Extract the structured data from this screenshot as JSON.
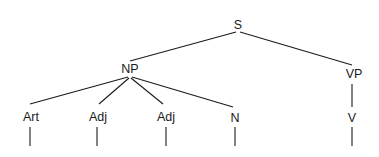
{
  "diagram": {
    "type": "syntax-tree",
    "nodes": {
      "s": {
        "label": "S",
        "x": 238,
        "y": 29
      },
      "np": {
        "label": "NP",
        "x": 130,
        "y": 72
      },
      "vp": {
        "label": "VP",
        "x": 355,
        "y": 77
      },
      "art": {
        "label": "Art",
        "x": 31,
        "y": 121
      },
      "adj1": {
        "label": "Adj",
        "x": 97,
        "y": 121
      },
      "adj2": {
        "label": "Adj",
        "x": 166,
        "y": 121
      },
      "n": {
        "label": "N",
        "x": 235,
        "y": 122
      },
      "v": {
        "label": "V",
        "x": 352,
        "y": 122
      }
    },
    "edges": [
      {
        "from": "S",
        "to": "NP"
      },
      {
        "from": "S",
        "to": "VP"
      },
      {
        "from": "NP",
        "to": "Art"
      },
      {
        "from": "NP",
        "to": "Adj"
      },
      {
        "from": "NP",
        "to": "Adj"
      },
      {
        "from": "NP",
        "to": "N"
      },
      {
        "from": "VP",
        "to": "V"
      }
    ],
    "line_color": "#1a1a1a"
  }
}
